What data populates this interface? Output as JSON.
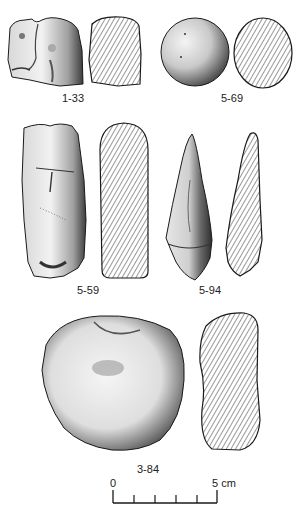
{
  "plate": {
    "type": "archaeological artifact drawing plate",
    "colors": {
      "ink": "#1a1a1a",
      "background": "#ffffff",
      "hatch": "#333333"
    }
  },
  "artifacts": [
    {
      "id": "1-33",
      "label": "1-33",
      "view": "stone-drawing",
      "section": "hatched-cross-section"
    },
    {
      "id": "5-69",
      "label": "5-69",
      "view": "sphere-drawing",
      "section": "hatched-cross-section"
    },
    {
      "id": "5-59",
      "label": "5-59",
      "view": "elongated-stone-drawing",
      "section": "hatched-cross-section"
    },
    {
      "id": "5-94",
      "label": "5-94",
      "view": "pointed-stone-drawing",
      "section": "hatched-cross-section"
    },
    {
      "id": "3-84",
      "label": "3-84",
      "view": "rounded-stone-drawing",
      "section": "hatched-cross-section"
    }
  ],
  "scale_bar": {
    "start_label": "0",
    "end_label": "5 cm",
    "divisions": 5
  }
}
